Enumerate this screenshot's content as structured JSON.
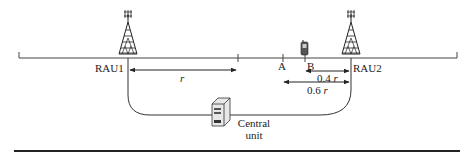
{
  "diagram": {
    "nodes": {
      "rau1": {
        "label": "RAU1",
        "x": 128
      },
      "rau2": {
        "label": "RAU2",
        "x": 351
      },
      "central_unit": {
        "label_line1": "Central",
        "label_line2": "unit"
      },
      "point_a": {
        "label": "A",
        "x": 283
      },
      "point_b": {
        "label": "B",
        "x": 305
      }
    },
    "distances": {
      "r": {
        "label": "r"
      },
      "d04": {
        "value": "0.4",
        "unit": "r"
      },
      "d06": {
        "value": "0.6",
        "unit": "r"
      }
    },
    "colors": {
      "line": "#333333",
      "bottom_rule": "#222222"
    }
  }
}
